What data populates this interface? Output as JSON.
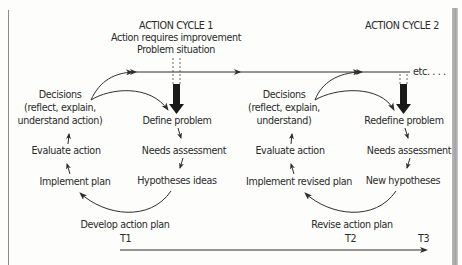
{
  "cycle1": {
    "heading": "ACTION CYCLE 1",
    "subheading_1": "Action requires improvement",
    "subheading_2": "Problem situation",
    "decisions_1": "Decisions",
    "decisions_2": "(reflect, explain,",
    "decisions_3": "understand action)",
    "steps": {
      "define": "Define problem",
      "needs": "Needs assessment",
      "hypotheses": "Hypotheses ideas",
      "develop": "Develop action plan",
      "implement": "Implement plan",
      "evaluate": "Evaluate action"
    }
  },
  "cycle2": {
    "heading": "ACTION CYCLE 2",
    "decisions_1": "Decisions",
    "decisions_2": "(reflect, explain,",
    "decisions_3": "understand)",
    "steps": {
      "define": "Redefine problem",
      "needs": "Needs assessment",
      "hypotheses": "New hypotheses",
      "develop": "Revise action plan",
      "implement": "Implement revised plan",
      "evaluate": "Evaluate action"
    }
  },
  "continuation": "etc. . . .",
  "timeline": {
    "t1": "T1",
    "t2": "T2",
    "t3": "T3"
  },
  "colors": {
    "line": "#2e2e2e",
    "text": "#2a2a2a",
    "thick_arrow": "#1a1a1a"
  }
}
